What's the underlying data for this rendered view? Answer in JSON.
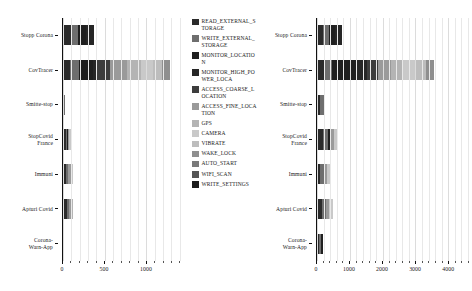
{
  "figure": {
    "type": "grouped-figure",
    "orientation": "horizontal-stacked-bar",
    "panel_count": 2
  },
  "legend": {
    "position": "center",
    "entries": [
      {
        "label": "READ_EXTERNAL_STORAGE",
        "color": "#2b2b2b"
      },
      {
        "label": "WRITE_EXTERNAL_STORAGE",
        "color": "#6e6e6e"
      },
      {
        "label": "MONITOR_LOCATION",
        "color": "#1f1f1f"
      },
      {
        "label": "MONITOR_HIGH_POWER_LOCA",
        "color": "#262626"
      },
      {
        "label": "ACCESS_COARSE_LOCATION",
        "color": "#3d3d3d"
      },
      {
        "label": "ACCESS_FINE_LOCATION",
        "color": "#9a9a9a"
      },
      {
        "label": "GPS",
        "color": "#b4b4b4"
      },
      {
        "label": "CAMERA",
        "color": "#c9c9c9"
      },
      {
        "label": "VIBRATE",
        "color": "#bdbdbd"
      },
      {
        "label": "WAKE_LOCK",
        "color": "#8f8f8f"
      },
      {
        "label": "AUTO_START",
        "color": "#7a7a7a"
      },
      {
        "label": "WIFI_SCAN",
        "color": "#555555"
      },
      {
        "label": "WRITE_SETTINGS",
        "color": "#1c1c1c"
      }
    ]
  },
  "chart_data": [
    {
      "id": "left",
      "type": "bar",
      "orientation": "horizontal",
      "stacked": true,
      "title": "",
      "xlabel": "",
      "ylabel": "",
      "xlim": [
        0,
        1430
      ],
      "grid": true,
      "xticks": [
        0,
        500,
        1000
      ],
      "xticklabels": [
        "0",
        "500",
        "1000"
      ],
      "categories": [
        "Stopp Corona",
        "CovTracer",
        "Smitte-stop",
        "StopCovid\nFrance",
        "Immuni",
        "Apturi Covid",
        "Corona-\nWarn-App"
      ],
      "series": [
        {
          "name": "READ_EXTERNAL_STORAGE",
          "values": [
            190,
            95,
            75,
            135,
            110,
            160,
            60
          ]
        },
        {
          "name": "WRITE_EXTERNAL_STORAGE",
          "values": [
            165,
            110,
            65,
            60,
            110,
            105,
            20
          ]
        },
        {
          "name": "MONITOR_LOCATION",
          "values": [
            190,
            175,
            0,
            30,
            0,
            0,
            0
          ]
        },
        {
          "name": "MONITOR_HIGH_POWER_LOCA",
          "values": [
            185,
            55,
            0,
            0,
            0,
            0,
            0
          ]
        },
        {
          "name": "ACCESS_COARSE_LOCATION",
          "values": [
            0,
            165,
            0,
            0,
            0,
            0,
            0
          ]
        },
        {
          "name": "ACCESS_FINE_LOCATION",
          "values": [
            0,
            210,
            0,
            65,
            110,
            80,
            0
          ]
        },
        {
          "name": "GPS",
          "values": [
            0,
            175,
            0,
            0,
            0,
            75,
            0
          ]
        },
        {
          "name": "CAMERA",
          "values": [
            0,
            160,
            0,
            70,
            85,
            0,
            0
          ]
        },
        {
          "name": "VIBRATE",
          "values": [
            0,
            115,
            0,
            0,
            0,
            0,
            0
          ]
        },
        {
          "name": "WAKE_LOCK",
          "values": [
            0,
            95,
            0,
            0,
            0,
            0,
            0
          ]
        },
        {
          "name": "AUTO_START",
          "values": [
            0,
            0,
            0,
            0,
            0,
            0,
            0
          ]
        },
        {
          "name": "WIFI_SCAN",
          "values": [
            0,
            0,
            0,
            0,
            0,
            0,
            0
          ]
        },
        {
          "name": "WRITE_SETTINGS",
          "values": [
            0,
            0,
            0,
            0,
            0,
            0,
            0
          ]
        }
      ],
      "totals": [
        730,
        1355,
        140,
        360,
        415,
        420,
        80
      ]
    },
    {
      "id": "right",
      "type": "bar",
      "orientation": "horizontal",
      "stacked": true,
      "title": "",
      "xlabel": "",
      "ylabel": "",
      "xlim": [
        0,
        4600
      ],
      "grid": true,
      "xticks": [
        0,
        1000,
        2000,
        3000,
        4000
      ],
      "xticklabels": [
        "0",
        "1000",
        "2000",
        "3000",
        "4000"
      ],
      "categories": [
        "Stopp Corona",
        "CovTracer",
        "Smitte-stop",
        "StopCovid\nFrance",
        "Immuni",
        "Apturi Covid",
        "Corona-\nWarn-App"
      ],
      "series": [
        {
          "name": "READ_EXTERNAL_STORAGE",
          "values": [
            460,
            260,
            420,
            480,
            350,
            430,
            340
          ]
        },
        {
          "name": "WRITE_EXTERNAL_STORAGE",
          "values": [
            420,
            250,
            540,
            450,
            360,
            390,
            280
          ]
        },
        {
          "name": "MONITOR_LOCATION",
          "values": [
            470,
            830,
            0,
            130,
            0,
            0,
            290
          ]
        },
        {
          "name": "MONITOR_HIGH_POWER_LOCA",
          "values": [
            510,
            380,
            0,
            0,
            0,
            0,
            0
          ]
        },
        {
          "name": "ACCESS_COARSE_LOCATION",
          "values": [
            0,
            390,
            0,
            0,
            0,
            0,
            0
          ]
        },
        {
          "name": "ACCESS_FINE_LOCATION",
          "values": [
            0,
            440,
            0,
            350,
            310,
            310,
            0
          ]
        },
        {
          "name": "GPS",
          "values": [
            0,
            400,
            0,
            0,
            0,
            0,
            0
          ]
        },
        {
          "name": "CAMERA",
          "values": [
            0,
            460,
            0,
            280,
            330,
            350,
            0
          ]
        },
        {
          "name": "VIBRATE",
          "values": [
            0,
            370,
            0,
            0,
            0,
            0,
            0
          ]
        },
        {
          "name": "WAKE_LOCK",
          "values": [
            0,
            270,
            0,
            0,
            0,
            0,
            0
          ]
        },
        {
          "name": "AUTO_START",
          "values": [
            0,
            0,
            0,
            0,
            0,
            0,
            0
          ]
        },
        {
          "name": "WIFI_SCAN",
          "values": [
            0,
            0,
            0,
            0,
            0,
            0,
            0
          ]
        },
        {
          "name": "WRITE_SETTINGS",
          "values": [
            0,
            0,
            0,
            0,
            0,
            0,
            0
          ]
        }
      ],
      "totals": [
        1860,
        4050,
        960,
        1690,
        1350,
        1480,
        910
      ]
    }
  ]
}
